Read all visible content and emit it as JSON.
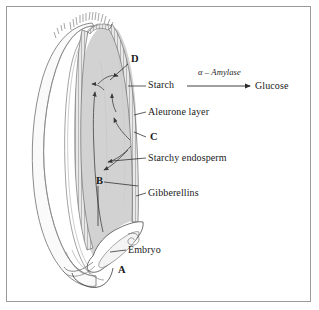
{
  "figure": {
    "frame_color": "#9a9a9a",
    "background_color": "#ffffff",
    "endosperm_fill": "#d2d2d2",
    "outer_lobe_fill": "#fafafa",
    "ink_color": "#1a1a1a"
  },
  "labels": {
    "starch": "Starch",
    "aleurone_layer": "Aleurone layer",
    "starchy_endosperm": "Starchy endosperm",
    "gibberellins": "Gibberellins",
    "embryo": "Embryo",
    "glucose": "Glucose",
    "enzyme": "α – Amylase"
  },
  "callouts": {
    "a": "A",
    "b": "B",
    "c": "C",
    "d": "D"
  }
}
